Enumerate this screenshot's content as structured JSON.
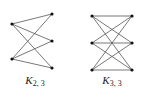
{
  "graphs": [
    {
      "name": "K",
      "subscript": "2, 3",
      "label_pos": [
        35,
        80
      ],
      "left": [
        [
          12,
          24
        ],
        [
          12,
          59
        ]
      ],
      "right": [
        [
          52,
          14
        ],
        [
          52,
          41
        ],
        [
          52,
          68
        ]
      ]
    },
    {
      "name": "K",
      "subscript": "3, 3",
      "label_pos": [
        112,
        80
      ],
      "left": [
        [
          92,
          16
        ],
        [
          92,
          43
        ],
        [
          92,
          70
        ]
      ],
      "right": [
        [
          132,
          16
        ],
        [
          132,
          43
        ],
        [
          132,
          70
        ]
      ]
    }
  ],
  "colors": {
    "edge": "#555555",
    "vertex": "#111111",
    "text": "#222222"
  }
}
